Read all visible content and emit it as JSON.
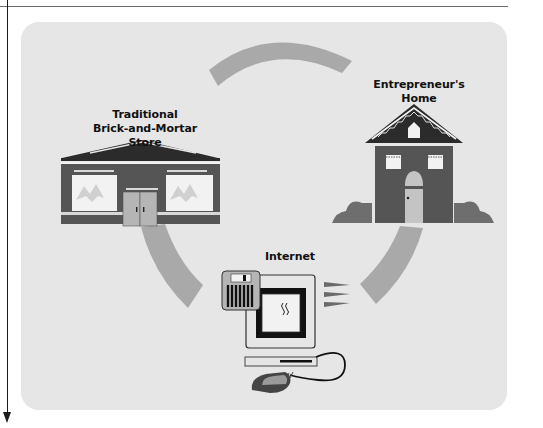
{
  "figure": {
    "nodes": [
      {
        "id": "store",
        "label_line1": "Traditional",
        "label_line2": "Brick-and-Mortar Store",
        "icon": "storefront-icon"
      },
      {
        "id": "home",
        "label_line1": "Entrepreneur's",
        "label_line2": "Home",
        "icon": "house-icon"
      },
      {
        "id": "internet",
        "label_line1": "Internet",
        "icon": "computer-icon"
      }
    ],
    "connectors": [
      "arc-top",
      "arc-left",
      "arc-right"
    ]
  },
  "colors": {
    "panel_bg": "#e6e6e6",
    "arc": "#a9a9a9",
    "building": "#555555",
    "roof": "#2b2b2b",
    "window": "#f2f2f2",
    "door": "#b5b5b5",
    "shrub": "#6e6e6e"
  }
}
